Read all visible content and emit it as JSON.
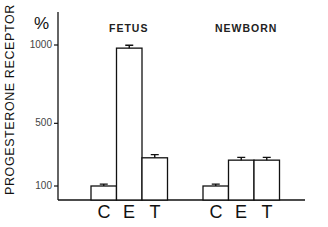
{
  "chart_data": {
    "type": "bar",
    "title": "",
    "ylabel": "PROGESTERONE RECEPTOR",
    "yunit": "%",
    "ylim": [
      10,
      1100
    ],
    "yticks": [
      100,
      500,
      1000
    ],
    "ytick_labels": [
      "100",
      "500",
      "1000"
    ],
    "grid": false,
    "legend": null,
    "groups": [
      {
        "name": "FETUS",
        "categories": [
          "C",
          "E",
          "T"
        ],
        "values": [
          100,
          980,
          280
        ],
        "errors": [
          12,
          18,
          20
        ]
      },
      {
        "name": "NEWBORN",
        "categories": [
          "C",
          "E",
          "T"
        ],
        "values": [
          100,
          265,
          265
        ],
        "errors": [
          12,
          18,
          18
        ]
      }
    ]
  },
  "labels": {
    "ylabel": "PROGESTERONE RECEPTOR",
    "unit": "%",
    "ticks": [
      "1000",
      "500",
      "100"
    ],
    "fetus": "FETUS",
    "newborn": "NEWBORN",
    "cats": [
      "C",
      "E",
      "T",
      "C",
      "E",
      "T"
    ]
  }
}
